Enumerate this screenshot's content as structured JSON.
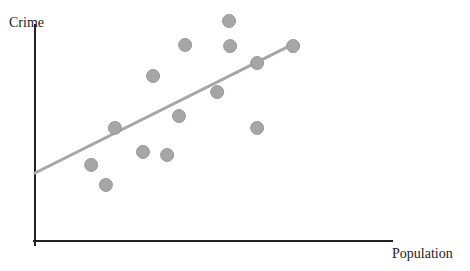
{
  "chart_data": {
    "type": "scatter",
    "title": "",
    "xlabel": "Population",
    "ylabel": "Crime",
    "grid": false,
    "legend": null,
    "ticks": false,
    "xlim": [
      0,
      100
    ],
    "ylim": [
      0,
      100
    ],
    "points": [
      {
        "x": 15.6,
        "y": 34.6
      },
      {
        "x": 19.7,
        "y": 25.5
      },
      {
        "x": 22.2,
        "y": 51.4
      },
      {
        "x": 30.0,
        "y": 40.5
      },
      {
        "x": 32.8,
        "y": 75.0
      },
      {
        "x": 36.7,
        "y": 39.1
      },
      {
        "x": 40.0,
        "y": 56.8
      },
      {
        "x": 41.7,
        "y": 89.1
      },
      {
        "x": 50.6,
        "y": 67.7
      },
      {
        "x": 53.9,
        "y": 100.0
      },
      {
        "x": 54.2,
        "y": 88.6
      },
      {
        "x": 61.7,
        "y": 80.9
      },
      {
        "x": 61.7,
        "y": 51.4
      },
      {
        "x": 71.7,
        "y": 88.6
      }
    ],
    "trendline": {
      "x": [
        0,
        71.7
      ],
      "y": [
        30.9,
        89.5
      ],
      "color": "#a6a6a6"
    },
    "marker_color": "#a6a6a6",
    "marker_edge": "#999999"
  },
  "labels": {
    "y_axis": "Crime",
    "x_axis": "Population"
  },
  "layout_px": {
    "origin": [
      35,
      241
    ],
    "x_axis_end": 393,
    "y_axis_top": 25,
    "plot_x_range_px": [
      35,
      395
    ],
    "plot_y_range_px": [
      241,
      21
    ]
  }
}
